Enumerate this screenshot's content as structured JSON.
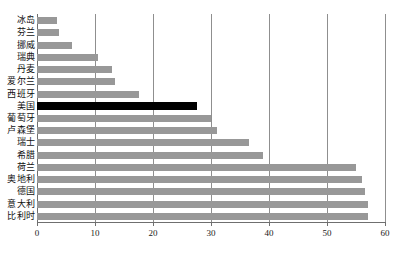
{
  "chart_data": {
    "type": "bar",
    "orientation": "horizontal",
    "title": "",
    "xlabel": "",
    "ylabel": "",
    "xlim": [
      0,
      60
    ],
    "xticks": [
      0,
      10,
      20,
      30,
      40,
      50,
      60
    ],
    "grid": true,
    "legend": null,
    "categories": [
      "冰岛",
      "芬兰",
      "挪威",
      "瑞典",
      "丹麦",
      "爱尔兰",
      "西班牙",
      "美国",
      "葡萄牙",
      "卢森堡",
      "瑞士",
      "希腊",
      "荷兰",
      "奥地利",
      "德国",
      "意大利",
      "比利时"
    ],
    "values": [
      3.4,
      3.8,
      6.0,
      10.5,
      13.0,
      13.4,
      17.5,
      27.5,
      30.0,
      31.0,
      36.5,
      39.0,
      55.0,
      56.0,
      56.5,
      57.0,
      57.0
    ],
    "highlight_category": "美国",
    "colors": {
      "bar": "#989898",
      "highlight_bar": "#000000",
      "grid": "#8f8f8f",
      "axis": "#6f6f6f",
      "text": "#111111",
      "background": "#ffffff"
    }
  }
}
